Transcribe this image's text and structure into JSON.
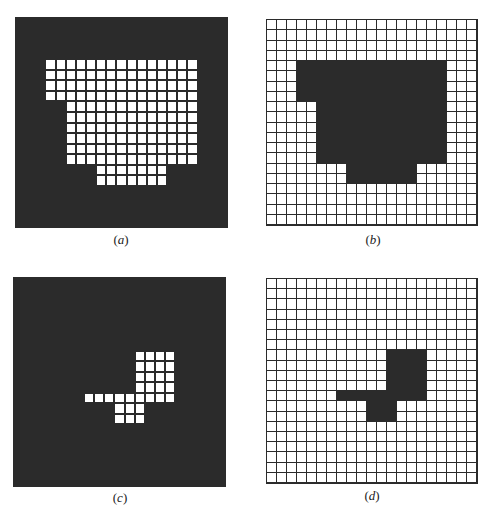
{
  "figure": {
    "grid_cols": 21,
    "grid_rows": 20,
    "colors": {
      "dark": "#2b2b2b",
      "light": "#ffffff",
      "line": "#2b2b2b"
    },
    "panels": [
      {
        "id": "a",
        "label": "a",
        "style": "dark-background-white-cells",
        "box": {
          "x": 15,
          "y": 17,
          "w": 213,
          "h": 211
        },
        "label_pos": {
          "x": 101,
          "y": 232
        },
        "shape_rows": [
          {
            "row": 4,
            "from": 3,
            "to": 17
          },
          {
            "row": 5,
            "from": 3,
            "to": 17
          },
          {
            "row": 6,
            "from": 3,
            "to": 17
          },
          {
            "row": 7,
            "from": 3,
            "to": 17
          },
          {
            "row": 8,
            "from": 5,
            "to": 17
          },
          {
            "row": 9,
            "from": 5,
            "to": 17
          },
          {
            "row": 10,
            "from": 5,
            "to": 17
          },
          {
            "row": 11,
            "from": 5,
            "to": 17
          },
          {
            "row": 12,
            "from": 5,
            "to": 17
          },
          {
            "row": 13,
            "from": 5,
            "to": 17
          },
          {
            "row": 14,
            "from": 8,
            "to": 14
          },
          {
            "row": 15,
            "from": 8,
            "to": 14
          }
        ]
      },
      {
        "id": "b",
        "label": "b",
        "style": "white-grid-dark-shape",
        "box": {
          "x": 266,
          "y": 19,
          "w": 212,
          "h": 207
        },
        "label_pos": {
          "x": 353,
          "y": 232
        },
        "shape_rows": [
          {
            "row": 4,
            "from": 3,
            "to": 17
          },
          {
            "row": 5,
            "from": 3,
            "to": 17
          },
          {
            "row": 6,
            "from": 3,
            "to": 17
          },
          {
            "row": 7,
            "from": 3,
            "to": 17
          },
          {
            "row": 8,
            "from": 5,
            "to": 17
          },
          {
            "row": 9,
            "from": 5,
            "to": 17
          },
          {
            "row": 10,
            "from": 5,
            "to": 17
          },
          {
            "row": 11,
            "from": 5,
            "to": 17
          },
          {
            "row": 12,
            "from": 5,
            "to": 17
          },
          {
            "row": 13,
            "from": 5,
            "to": 17
          },
          {
            "row": 14,
            "from": 8,
            "to": 14
          },
          {
            "row": 15,
            "from": 8,
            "to": 14
          }
        ]
      },
      {
        "id": "c",
        "label": "c",
        "style": "dark-background-white-cells",
        "box": {
          "x": 13,
          "y": 277,
          "w": 213,
          "h": 210
        },
        "label_pos": {
          "x": 100,
          "y": 490
        },
        "shape_rows": [
          {
            "row": 7,
            "from": 12,
            "to": 15
          },
          {
            "row": 8,
            "from": 12,
            "to": 15
          },
          {
            "row": 9,
            "from": 12,
            "to": 15
          },
          {
            "row": 10,
            "from": 12,
            "to": 15
          },
          {
            "row": 11,
            "from": 7,
            "to": 15
          },
          {
            "row": 12,
            "from": 10,
            "to": 12
          },
          {
            "row": 13,
            "from": 10,
            "to": 12
          }
        ]
      },
      {
        "id": "d",
        "label": "d",
        "style": "white-grid-dark-shape",
        "box": {
          "x": 266,
          "y": 278,
          "w": 212,
          "h": 206
        },
        "label_pos": {
          "x": 352,
          "y": 488
        },
        "shape_rows": [
          {
            "row": 7,
            "from": 12,
            "to": 15
          },
          {
            "row": 8,
            "from": 12,
            "to": 15
          },
          {
            "row": 9,
            "from": 12,
            "to": 15
          },
          {
            "row": 10,
            "from": 12,
            "to": 15
          },
          {
            "row": 11,
            "from": 7,
            "to": 15
          },
          {
            "row": 12,
            "from": 10,
            "to": 12
          },
          {
            "row": 13,
            "from": 10,
            "to": 12
          }
        ]
      }
    ]
  }
}
